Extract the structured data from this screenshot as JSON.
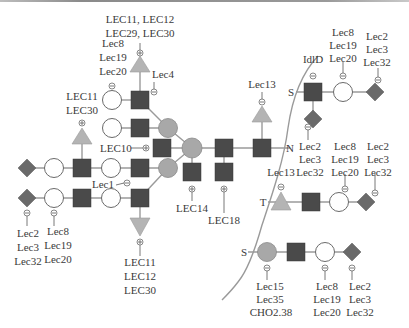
{
  "diagram": {
    "colors": {
      "square": "#4a4a4a",
      "grey_circle": "#a8a8a8",
      "white_circle": "#ffffff",
      "triangle": "#b4b4b4",
      "diamond": "#6a6a6a",
      "line": "#9a9a9a"
    },
    "linkage_labels": {
      "N": "N",
      "S_top": "S",
      "T": "T",
      "S_bottom": "S"
    },
    "n_glycan": {
      "top_triangle_label": [
        "LEC11, LEC12",
        "LEC29, LEC30"
      ],
      "top_circle_label": [
        "Lec8",
        "Lec19",
        "Lec20"
      ],
      "lec4_label": "Lec4",
      "left_triangle_label": [
        "LEC11",
        "LEC30"
      ],
      "lec10_label": "LEC10",
      "lec1_label": "Lec1",
      "core_triangle_label": "Lec13",
      "lec14_label": "LEC14",
      "lec18_label": "LEC18",
      "left_diamond_label": [
        "Lec2",
        "Lec3",
        "Lec32"
      ],
      "left_circle_label": [
        "Lec8",
        "Lec19",
        "Lec20"
      ],
      "bottom_triangle_label": [
        "LEC11",
        "LEC12",
        "LEC30"
      ]
    },
    "o_glycan_s_top": {
      "square_label": "IdlD",
      "circle_label": [
        "Lec8",
        "Lec19",
        "Lec20"
      ],
      "diamond_label": [
        "Lec2",
        "Lec3",
        "Lec32"
      ],
      "lower_diamond_label": [
        "Lec2",
        "Lec3",
        "Lec32"
      ]
    },
    "o_glycan_t": {
      "triangle_label": "Lec13",
      "circle_label": [
        "Lec8",
        "Lec19",
        "Lec20"
      ],
      "diamond_label": [
        "Lec2",
        "Lec3",
        "Lec32"
      ]
    },
    "o_glycan_s_bottom": {
      "grey_circle_label": [
        "Lec15",
        "Lec35",
        "CHO2.38"
      ],
      "circle_label": [
        "Lec8",
        "Lec19",
        "Lec20"
      ],
      "diamond_label": [
        "Lec2",
        "Lec3",
        "Lec32"
      ]
    }
  }
}
